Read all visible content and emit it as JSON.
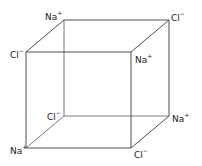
{
  "diagram": {
    "vertices": [
      {
        "id": "back-top-left",
        "x": 64,
        "y": 20,
        "ion": "Na",
        "charge": "+",
        "label_x": 45,
        "label_y": 11
      },
      {
        "id": "back-top-right",
        "x": 169,
        "y": 20,
        "ion": "Cl",
        "charge": "−",
        "label_x": 171,
        "label_y": 12
      },
      {
        "id": "front-top-left",
        "x": 26,
        "y": 52,
        "ion": "Cl",
        "charge": "−",
        "label_x": 10,
        "label_y": 49
      },
      {
        "id": "front-top-right",
        "x": 131,
        "y": 52,
        "ion": "Na",
        "charge": "+",
        "label_x": 135,
        "label_y": 54
      },
      {
        "id": "back-bottom-left",
        "x": 64,
        "y": 116,
        "ion": "Cl",
        "charge": "−",
        "label_x": 47,
        "label_y": 111
      },
      {
        "id": "back-bottom-right",
        "x": 169,
        "y": 116,
        "ion": "Na",
        "charge": "+",
        "label_x": 172,
        "label_y": 113
      },
      {
        "id": "front-bottom-left",
        "x": 26,
        "y": 148,
        "ion": "Na",
        "charge": "+",
        "label_x": 10,
        "label_y": 145
      },
      {
        "id": "front-bottom-right",
        "x": 131,
        "y": 148,
        "ion": "Cl",
        "charge": "−",
        "label_x": 134,
        "label_y": 149
      }
    ],
    "labels": {
      "back_top_left": "Na",
      "back_top_left_charge": "+",
      "back_top_right": "Cl",
      "back_top_right_charge": "−",
      "front_top_left": "Cl",
      "front_top_left_charge": "−",
      "front_top_right": "Na",
      "front_top_right_charge": "+",
      "back_bottom_left": "Cl",
      "back_bottom_left_charge": "−",
      "back_bottom_right": "Na",
      "back_bottom_right_charge": "+",
      "front_bottom_left": "Na",
      "front_bottom_left_charge": "+",
      "front_bottom_right": "Cl",
      "front_bottom_right_charge": "−"
    },
    "colors": {
      "line": "#3a3a3a",
      "text": "#222222",
      "background": "#ffffff"
    }
  }
}
